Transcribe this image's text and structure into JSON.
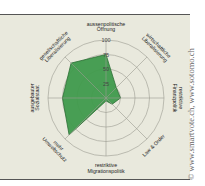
{
  "chart_data": {
    "type": "radar",
    "title": "",
    "axes": [
      "aussenpolitische Öffnung",
      "wirtschaftliche Liberalisierung",
      "restriktive Finanzpolitik",
      "Law & Order",
      "restriktive Migrationspolitik",
      "mehr Umweltschutz",
      "ausgebauter Sozialstaat",
      "gesellschaftliche Liberalisierung"
    ],
    "axis_labels_lines": [
      [
        "aussenpolitische",
        "Öffnung"
      ],
      [
        "wirtschaftliche",
        "Liberalisierung"
      ],
      [
        "restriktive",
        "Finanzpolitik"
      ],
      [
        "Law & Order"
      ],
      [
        "restriktive",
        "Migrationspolitik"
      ],
      [
        "mehr",
        "Umweltschutz"
      ],
      [
        "ausgebauter",
        "Sozialstaat"
      ],
      [
        "gesellschaftliche",
        "Liberalisierung"
      ]
    ],
    "series": [
      {
        "name": "Profil",
        "values": [
          75,
          25,
          25,
          15,
          5,
          90,
          75,
          85
        ],
        "color": "#3f9a4c"
      }
    ],
    "ticks": [
      25,
      50,
      75,
      100
    ],
    "tick_labels_shown": [
      "25",
      "50",
      "75",
      "100"
    ],
    "range": [
      0,
      100
    ],
    "grid": true,
    "legend": null
  },
  "credit": "© www.smartvote.ch, www.sotomo.ch",
  "colors": {
    "fill": "#3f9a4c",
    "stroke": "#2d6e36",
    "grid": "#9a9a90",
    "background": "#e9e9dd"
  }
}
